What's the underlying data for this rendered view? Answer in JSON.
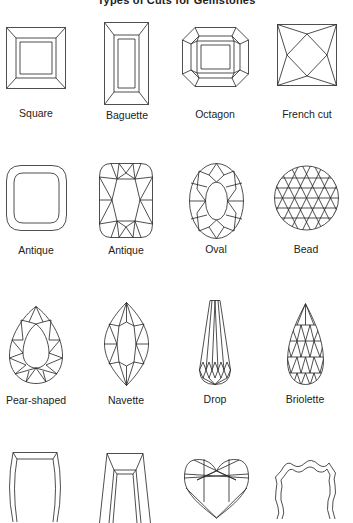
{
  "title": "Types of Cuts for Gemstones",
  "rows": [
    [
      {
        "name": "Square",
        "icon": "square-cut-icon"
      },
      {
        "name": "Baguette",
        "icon": "baguette-cut-icon"
      },
      {
        "name": "Octagon",
        "icon": "octagon-cut-icon"
      },
      {
        "name": "French cut",
        "icon": "french-cut-icon"
      }
    ],
    [
      {
        "name": "Antique",
        "icon": "antique-cushion-outline-icon"
      },
      {
        "name": "Antique",
        "icon": "antique-cushion-faceted-icon"
      },
      {
        "name": "Oval",
        "icon": "oval-cut-icon"
      },
      {
        "name": "Bead",
        "icon": "bead-cut-icon"
      }
    ],
    [
      {
        "name": "Pear-shaped",
        "icon": "pear-cut-icon"
      },
      {
        "name": "Navette",
        "icon": "navette-cut-icon"
      },
      {
        "name": "Drop",
        "icon": "drop-cut-icon"
      },
      {
        "name": "Briolette",
        "icon": "briolette-cut-icon"
      }
    ],
    [
      {
        "name": "",
        "icon": "barrel-cut-icon"
      },
      {
        "name": "",
        "icon": "trapeze-cut-icon"
      },
      {
        "name": "",
        "icon": "heart-cut-icon"
      },
      {
        "name": "",
        "icon": "shield-cut-icon"
      }
    ]
  ],
  "colors": {
    "line": "#222222",
    "background": "#ffffff"
  }
}
